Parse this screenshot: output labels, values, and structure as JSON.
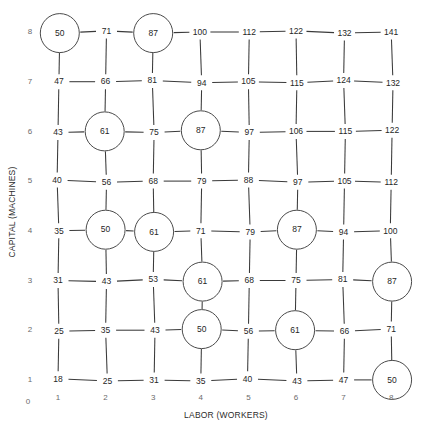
{
  "chart_data": {
    "type": "scatter",
    "title": "",
    "xlabel": "LABOR (WORKERS)",
    "ylabel": "CAPITAL (MACHINES)",
    "x_ticks": [
      "1",
      "2",
      "3",
      "4",
      "5",
      "6",
      "7",
      "8"
    ],
    "y_ticks": [
      "1",
      "2",
      "3",
      "4",
      "5",
      "6",
      "7",
      "8"
    ],
    "origin_label": "0",
    "xlim": [
      1,
      8
    ],
    "ylim": [
      1,
      8
    ],
    "grid": true,
    "legend": "none",
    "x_values": [
      1,
      2,
      3,
      4,
      5,
      6,
      7,
      8
    ],
    "y_values": [
      1,
      2,
      3,
      4,
      5,
      6,
      7,
      8
    ],
    "note": "Production function grid: total output at each labor/capital combination. Circled nodes mark equal-output isoquant levels 50, 61, 87.",
    "rows": [
      {
        "capital": 8,
        "values": [
          50,
          71,
          87,
          100,
          112,
          122,
          132,
          141
        ],
        "circled": [
          1,
          3
        ]
      },
      {
        "capital": 7,
        "values": [
          47,
          66,
          81,
          94,
          105,
          115,
          124,
          132
        ],
        "circled": []
      },
      {
        "capital": 6,
        "values": [
          43,
          61,
          75,
          87,
          97,
          106,
          115,
          122
        ],
        "circled": [
          2,
          4
        ]
      },
      {
        "capital": 5,
        "values": [
          40,
          56,
          68,
          79,
          88,
          97,
          105,
          112
        ],
        "circled": []
      },
      {
        "capital": 4,
        "values": [
          35,
          50,
          61,
          71,
          79,
          87,
          94,
          100
        ],
        "circled": [
          2,
          3,
          6
        ]
      },
      {
        "capital": 3,
        "values": [
          31,
          43,
          53,
          61,
          68,
          75,
          81,
          87
        ],
        "circled": [
          4,
          8
        ]
      },
      {
        "capital": 2,
        "values": [
          25,
          35,
          43,
          50,
          56,
          61,
          66,
          71
        ],
        "circled": [
          4,
          6
        ]
      },
      {
        "capital": 1,
        "values": [
          18,
          25,
          31,
          35,
          40,
          43,
          47,
          50
        ],
        "circled": [
          8
        ]
      }
    ],
    "isoquant_levels": [
      50,
      61,
      87
    ],
    "circled_points": [
      {
        "labor": 1,
        "capital": 8,
        "output": 50
      },
      {
        "labor": 3,
        "capital": 8,
        "output": 87
      },
      {
        "labor": 2,
        "capital": 6,
        "output": 61
      },
      {
        "labor": 4,
        "capital": 6,
        "output": 87
      },
      {
        "labor": 2,
        "capital": 4,
        "output": 50
      },
      {
        "labor": 3,
        "capital": 4,
        "output": 61
      },
      {
        "labor": 6,
        "capital": 4,
        "output": 87
      },
      {
        "labor": 4,
        "capital": 3,
        "output": 61
      },
      {
        "labor": 8,
        "capital": 3,
        "output": 87
      },
      {
        "labor": 4,
        "capital": 2,
        "output": 50
      },
      {
        "labor": 6,
        "capital": 2,
        "output": 61
      },
      {
        "labor": 8,
        "capital": 1,
        "output": 50
      }
    ]
  },
  "colors": {
    "line": "#3a3a3a",
    "node_stroke": "#4a4a4a",
    "node_fill": "#ffffff",
    "text": "#262626",
    "tick_text": "#6b6b6b",
    "background": "#ffffff"
  }
}
